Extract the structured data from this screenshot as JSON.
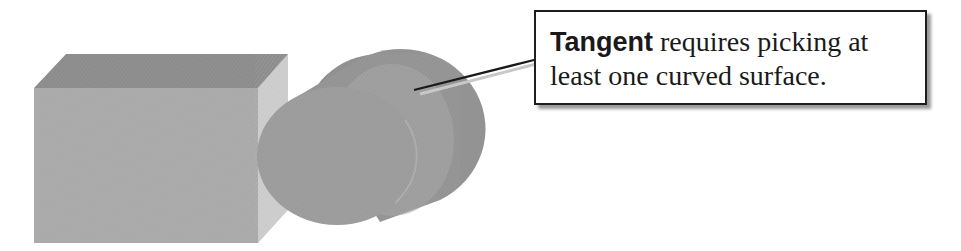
{
  "callout": {
    "bold_term": "Tangent",
    "line1_rest": " requires picking at",
    "line2": "least one curved surface."
  },
  "shapes": {
    "box": {
      "label": "rectangular block",
      "colors": {
        "top": "#8c8c8c",
        "front": "#a9a9a9",
        "side": "#cbcbcb"
      }
    },
    "cylinder": {
      "label": "cylinder",
      "colors": {
        "side": "#8f8f8f",
        "front": "#9b9b9b",
        "edge": "#b5b5b5"
      }
    }
  },
  "arrow": {
    "color": "#1a1a1a",
    "shadow_color": "#c8c8c8"
  }
}
